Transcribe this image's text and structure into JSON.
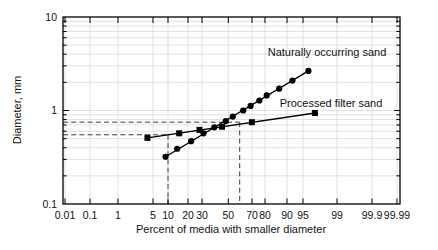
{
  "chart_data": {
    "type": "scatter",
    "title": "",
    "xlabel": "Percent of media with smaller diameter",
    "ylabel": "Diameter, mm",
    "x_scale": "normal-probability",
    "y_scale": "log",
    "xlim": [
      0.01,
      99.99
    ],
    "ylim": [
      0.1,
      10
    ],
    "grid": true,
    "x_ticks": [
      "0.01",
      "0.1",
      "1",
      "5",
      "10",
      "20",
      "30",
      "50",
      "70",
      "80",
      "90",
      "95",
      "99",
      "99.9",
      "99.99"
    ],
    "y_ticks": [
      "10",
      "1",
      "0.1"
    ],
    "series": [
      {
        "name": "Naturally occurring sand",
        "marker": "circle",
        "color": "#000000",
        "points": [
          [
            9,
            0.32
          ],
          [
            14,
            0.39
          ],
          [
            22,
            0.47
          ],
          [
            31,
            0.57
          ],
          [
            39,
            0.66
          ],
          [
            48,
            0.77
          ],
          [
            54,
            0.86
          ],
          [
            63,
            1.0
          ],
          [
            69,
            1.12
          ],
          [
            76,
            1.28
          ],
          [
            81,
            1.45
          ],
          [
            87,
            1.71
          ],
          [
            92,
            2.09
          ],
          [
            96,
            2.65
          ]
        ]
      },
      {
        "name": "Processed filter sand",
        "marker": "square",
        "color": "#000000",
        "points": [
          [
            4,
            0.51
          ],
          [
            15,
            0.57
          ],
          [
            28,
            0.62
          ],
          [
            45,
            0.67
          ],
          [
            70,
            0.75
          ],
          [
            97,
            0.94
          ]
        ]
      }
    ],
    "guides": [
      {
        "name": "d10",
        "percent": 10,
        "diameter": 0.55
      },
      {
        "name": "d60",
        "percent": 60,
        "diameter": 0.75
      }
    ],
    "colors": {
      "line": "#000000",
      "grid": "#d4d4d4",
      "dashed": "#3c3c3c",
      "background": "#ffffff"
    }
  }
}
